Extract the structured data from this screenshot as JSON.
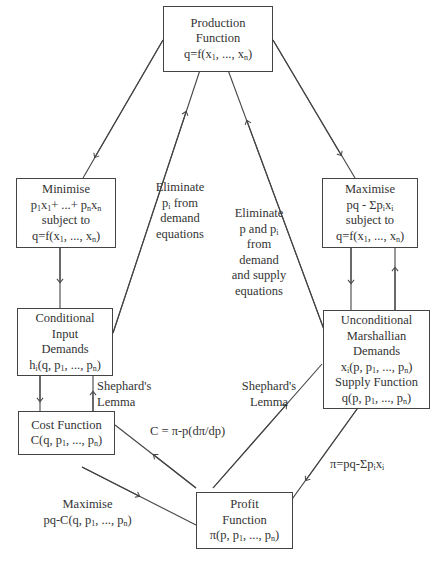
{
  "nodes": {
    "production": {
      "lines": [
        "Production",
        "Function",
        "q=f(x<sub>1</sub>, ..., x<sub>n</sub>)"
      ]
    },
    "minimise": {
      "lines": [
        "Minimise",
        "p<sub>1</sub>x<sub>1</sub>+ ...+ p<sub>n</sub>x<sub>n</sub>",
        "subject to",
        "q=f(x<sub>1</sub>, ..., x<sub>n</sub>)"
      ]
    },
    "maximise": {
      "lines": [
        "Maximise",
        "pq - Σp<sub>i</sub>x<sub>i</sub>",
        "subject to",
        "q=f(x<sub>1</sub>, ..., x<sub>n</sub>)"
      ]
    },
    "conditional": {
      "lines": [
        "Conditional",
        "Input",
        "Demands",
        "h<sub>i</sub>(q, p<sub>1</sub>, ..., p<sub>n</sub>)"
      ]
    },
    "unconditional": {
      "lines": [
        "Unconditional",
        "Marshallian",
        "Demands",
        "x<sub>i</sub>(p, p<sub>1</sub>, ..., p<sub>n</sub>)",
        "Supply Function",
        "q(p, p<sub>1</sub>, ..., p<sub>n</sub>)"
      ]
    },
    "cost": {
      "lines": [
        "Cost Function",
        "C(q, p<sub>1</sub>, ..., p<sub>n</sub>)"
      ]
    },
    "profit": {
      "lines": [
        "Profit",
        "Function",
        "π(p, p<sub>1</sub>, ..., p<sub>n</sub>)"
      ]
    }
  },
  "edge_labels": {
    "eliminate_pi": [
      "Eliminate",
      "p<sub>i</sub> from",
      "demand",
      "equations"
    ],
    "eliminate_p_pi": [
      "Eliminate",
      "p and p<sub>i</sub>",
      "from",
      "demand",
      "and supply",
      "equations"
    ],
    "shephard_left": [
      "Shephard's",
      "Lemma"
    ],
    "shephard_right": [
      "Shephard's",
      "Lemma"
    ],
    "cost_from_profit": [
      "C = π-p(dπ/dp)"
    ],
    "profit_def": [
      "π=pq-Σp<sub>i</sub>x<sub>i</sub>"
    ],
    "maximise_cost": [
      "Maximise",
      "pq-C(q, p<sub>1</sub>, ..., p<sub>n</sub>)"
    ]
  },
  "colors": {
    "line": "#444444",
    "text": "#333333",
    "background": "#ffffff"
  }
}
